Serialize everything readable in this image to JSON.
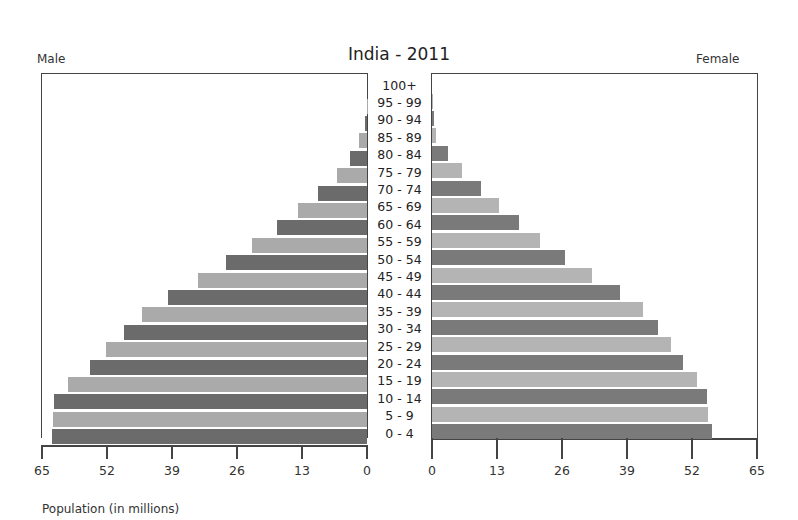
{
  "chart_data": {
    "type": "bar",
    "subtype": "population-pyramid",
    "title": "India - 2011",
    "left_label": "Male",
    "right_label": "Female",
    "xlabel": "Population (in millions)",
    "xlim": [
      0,
      65
    ],
    "x_ticks_left": [
      "65",
      "52",
      "39",
      "26",
      "13",
      "0"
    ],
    "x_ticks_right": [
      "0",
      "13",
      "26",
      "39",
      "52",
      "65"
    ],
    "categories": [
      "0 - 4",
      "5 - 9",
      "10 - 14",
      "15 - 19",
      "20 - 24",
      "25 - 29",
      "30 - 34",
      "35 - 39",
      "40 - 44",
      "45 - 49",
      "50 - 54",
      "55 - 59",
      "60 - 64",
      "65 - 69",
      "70 - 74",
      "75 - 79",
      "80 - 84",
      "85 - 89",
      "90 - 94",
      "95 - 99",
      "100+"
    ],
    "series": [
      {
        "name": "Male",
        "values": [
          63.0,
          62.8,
          62.6,
          59.8,
          55.4,
          52.2,
          48.6,
          45.0,
          39.8,
          33.8,
          28.2,
          23.0,
          18.0,
          13.8,
          9.8,
          6.0,
          3.4,
          1.6,
          0.4,
          0.1,
          0.0
        ]
      },
      {
        "name": "Female",
        "values": [
          56.0,
          55.2,
          55.0,
          53.0,
          50.2,
          47.8,
          45.2,
          42.2,
          37.6,
          32.0,
          26.6,
          21.6,
          17.4,
          13.4,
          9.8,
          6.0,
          3.2,
          0.8,
          0.3,
          0.1,
          0.0
        ]
      }
    ],
    "colors": {
      "dark": "#6b6b6b",
      "light": "#aaaaaa"
    },
    "grid": false,
    "legend": "none"
  }
}
